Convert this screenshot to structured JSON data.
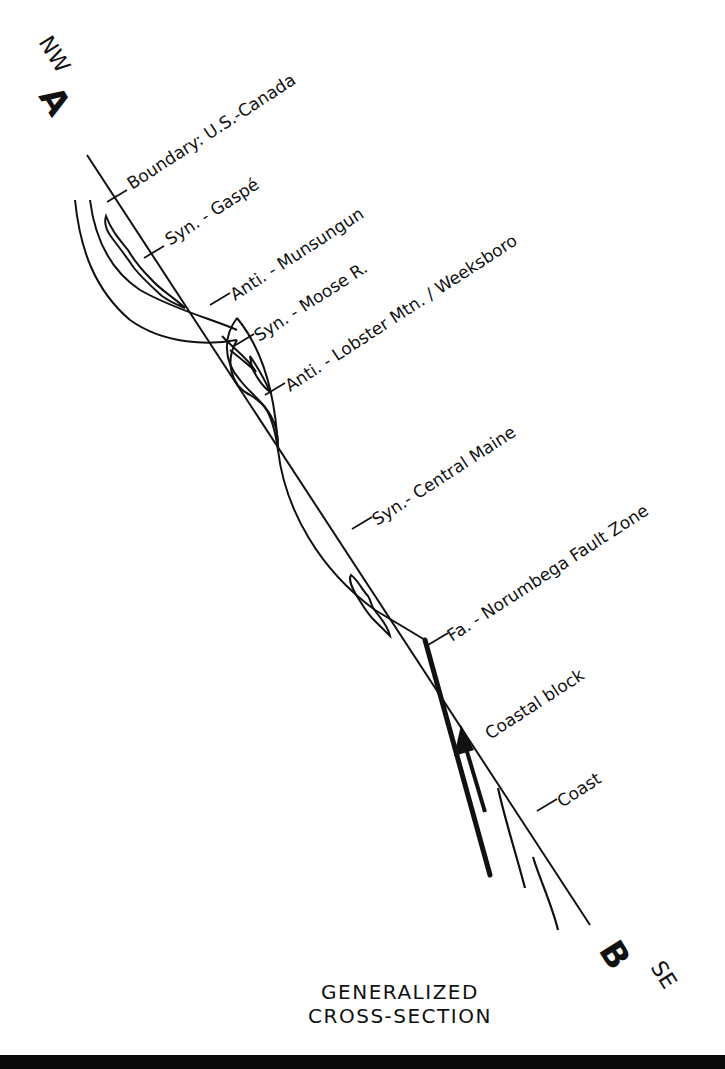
{
  "endpoints": {
    "start": {
      "letter": "A",
      "direction": "NW"
    },
    "end": {
      "letter": "B",
      "direction": "SE"
    }
  },
  "labels": [
    {
      "id": "boundary",
      "text": "Boundary: U.S.-Canada"
    },
    {
      "id": "syn-gaspe",
      "text": "Syn. - Gaspé"
    },
    {
      "id": "anti-munsungun",
      "text": "Anti. - Munsungun"
    },
    {
      "id": "syn-moose",
      "text": "Syn. - Moose R."
    },
    {
      "id": "anti-lobster",
      "text": "Anti. - Lobster Mtn. / Weeksboro"
    },
    {
      "id": "syn-central-maine",
      "text": "Syn.- Central Maine"
    },
    {
      "id": "fa-norumbega",
      "text": "Fa. - Norumbega Fault Zone"
    },
    {
      "id": "coastal-block",
      "text": "Coastal block"
    },
    {
      "id": "coast",
      "text": "Coast"
    }
  ],
  "title": {
    "line1": "GENERALIZED",
    "line2": "CROSS-SECTION"
  },
  "colors": {
    "ink": "#111111",
    "background": "#ffffff",
    "footer": "#0a0a0a"
  }
}
